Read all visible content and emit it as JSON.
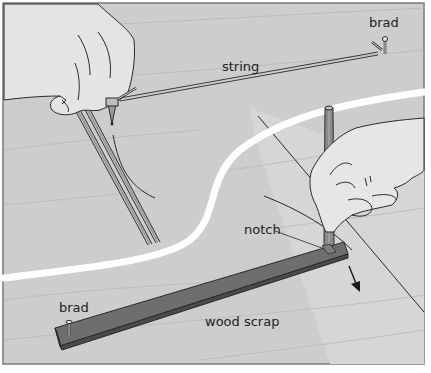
{
  "figure": {
    "type": "technical-illustration"
  },
  "labels": {
    "brad_top": "brad",
    "string": "string",
    "notch": "notch",
    "brad_bottom": "brad",
    "wood_scrap": "wood scrap"
  },
  "colors": {
    "background": "#c9c9c9",
    "board": "#d4d4d4",
    "frame_border": "#7a7a7a",
    "curve_white": "#ffffff",
    "wood_scrap": "#6e6e6e",
    "wood_scrap_dark": "#4a4a4a",
    "hand": "#e6e6e6",
    "line": "#2a2a2a"
  }
}
